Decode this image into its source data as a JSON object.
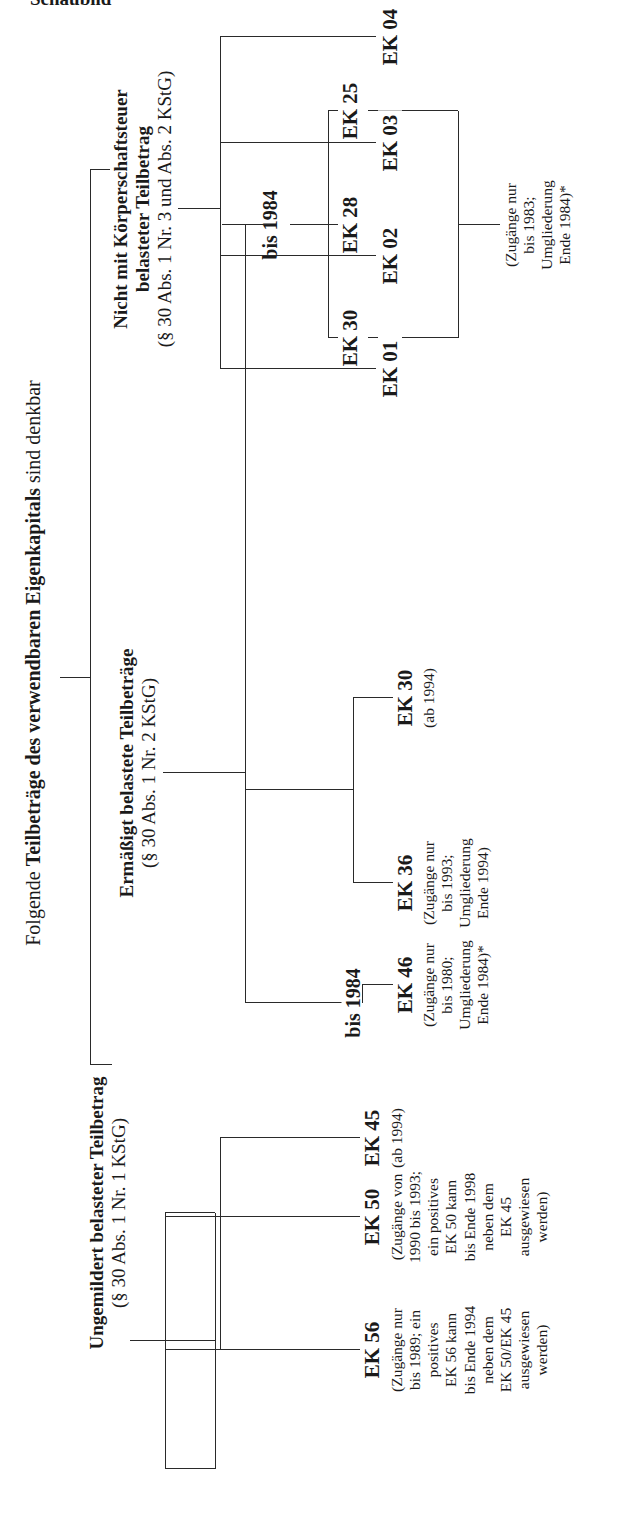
{
  "heading": "Schaubild",
  "root": {
    "prefix": "Folgende ",
    "bold": "Teilbeträge des verwendbaren Eigenkapitals",
    "suffix": " sind denkbar"
  },
  "categories": [
    {
      "title": "Ungemildert belasteter Teilbetrag",
      "subtitle": "(§ 30 Abs. 1 Nr. 1 KStG)",
      "items": [
        {
          "label": "EK 56",
          "note": [
            "(Zugänge nur",
            "bis 1989; ein",
            "positives",
            "EK 56 kann",
            "bis Ende 1994",
            "neben dem",
            "EK 50/EK 45",
            "ausgewiesen",
            "werden)"
          ]
        },
        {
          "label": "EK 50",
          "note": [
            "(Zugänge von",
            "1990 bis 1993;",
            "ein positives",
            "EK 50 kann",
            "bis Ende 1998",
            "neben dem",
            "EK 45",
            "ausgewiesen",
            "werden)"
          ]
        },
        {
          "label": "EK 45",
          "note": [
            "(ab 1994)"
          ]
        }
      ]
    },
    {
      "title": "Ermäßigt belastete Teilbeträge",
      "subtitle": "(§ 30 Abs. 1 Nr. 2 KStG)",
      "branch_label_left": "bis 1984",
      "branch_label_right": "bis 1984",
      "items": [
        {
          "label": "EK 46",
          "note": [
            "(Zugänge nur",
            "bis 1980;",
            "Umgliederung",
            "Ende 1984)*"
          ]
        },
        {
          "label": "EK 36",
          "note": [
            "(Zugänge nur",
            "bis 1993;",
            "Umgliederung",
            "Ende 1994)"
          ]
        },
        {
          "label": "EK 30",
          "note": [
            "(ab 1994)"
          ]
        }
      ],
      "subgroup": {
        "items": [
          {
            "label": "EK 30"
          },
          {
            "label": "EK 28"
          },
          {
            "label": "EK 25"
          }
        ],
        "note": [
          "(Zugänge nur",
          "bis 1983;",
          "Umgliederung",
          "Ende 1984)*"
        ]
      }
    },
    {
      "title_line1": "Nicht mit Körperschaftsteuer",
      "title_line2": "belasteter Teilbetrag",
      "subtitle": "(§ 30 Abs. 1 Nr. 3 und Abs. 2 KStG)",
      "items": [
        {
          "label": "EK 01"
        },
        {
          "label": "EK 02"
        },
        {
          "label": "EK 03"
        },
        {
          "label": "EK 04"
        }
      ]
    }
  ]
}
